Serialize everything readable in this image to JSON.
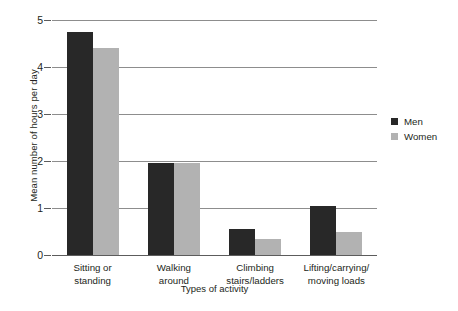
{
  "chart_data": {
    "type": "bar",
    "title": "",
    "xlabel": "Types of activity",
    "ylabel": "Mean number of hours per day",
    "categories": [
      "Sitting or\nstanding",
      "Walking\naround",
      "Climbing\nstairs/ladders",
      "Lifting/carrying/\nmoving loads"
    ],
    "series": [
      {
        "name": "Men",
        "color": "#282828",
        "values": [
          4.75,
          1.95,
          0.55,
          1.05
        ]
      },
      {
        "name": "Women",
        "color": "#b2b2b2",
        "values": [
          4.4,
          1.95,
          0.35,
          0.5
        ]
      }
    ],
    "ylim": [
      0,
      5
    ],
    "yticks": [
      "0",
      "1",
      "2",
      "3",
      "4",
      "5"
    ],
    "ytick_values": [
      0,
      1,
      2,
      3,
      4,
      5
    ],
    "grid": true,
    "legend_position": "right"
  },
  "legend": {
    "items": [
      {
        "label": "Men"
      },
      {
        "label": "Women"
      }
    ]
  },
  "axes": {
    "y_title": "Mean number of hours per day",
    "x_title": "Types of activity",
    "tick_0": "0",
    "tick_1": "1",
    "tick_2": "2",
    "tick_3": "3",
    "tick_4": "4",
    "tick_5": "5"
  },
  "categories": {
    "c0": "Sitting or\nstanding",
    "c1": "Walking\naround",
    "c2": "Climbing\nstairs/ladders",
    "c3": "Lifting/carrying/\nmoving loads"
  }
}
